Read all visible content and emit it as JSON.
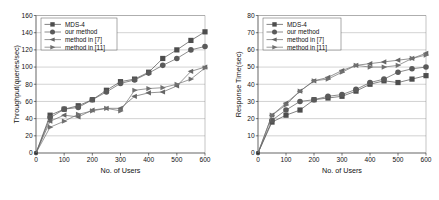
{
  "figure": {
    "panels": [
      "throughput-chart",
      "response-time-chart"
    ]
  },
  "chart_data": [
    {
      "id": "throughput-chart",
      "type": "line",
      "title": "",
      "xlabel": "No. of Users",
      "ylabel": "Throughput(queries/sec)",
      "xlim": [
        0,
        600
      ],
      "ylim": [
        0,
        160
      ],
      "xticks": [
        0,
        100,
        200,
        300,
        400,
        500,
        600
      ],
      "yticks": [
        0,
        20,
        40,
        60,
        80,
        100,
        120,
        140,
        160
      ],
      "xtick_labels": [
        "0",
        "100",
        "200",
        "300",
        "400",
        "500",
        "600"
      ],
      "ytick_labels": [
        "0",
        "20",
        "40",
        "60",
        "80",
        "100",
        "120",
        "140",
        "160"
      ],
      "grid": true,
      "legend_position": "upper-left",
      "x": [
        0,
        50,
        100,
        150,
        200,
        250,
        300,
        350,
        400,
        450,
        500,
        550,
        600
      ],
      "series": [
        {
          "name": "MDS-4",
          "marker": "square",
          "color": "#4d4d4d",
          "values": [
            0,
            44,
            51,
            55,
            62,
            73,
            83,
            86,
            94,
            110,
            120,
            131,
            141
          ]
        },
        {
          "name": "our method",
          "marker": "circle",
          "color": "#5a5a5a",
          "values": [
            0,
            41,
            51,
            53,
            62,
            71,
            81,
            85,
            93,
            102,
            110,
            120,
            124
          ]
        },
        {
          "name": "method in [7]",
          "marker": "triangle-left",
          "color": "#666666",
          "values": [
            0,
            37,
            44,
            42,
            50,
            52,
            52,
            66,
            70,
            71,
            78,
            95,
            100
          ]
        },
        {
          "name": "method in [11]",
          "marker": "triangle-right",
          "color": "#707070",
          "values": [
            0,
            30,
            37,
            45,
            49,
            52,
            49,
            73,
            75,
            76,
            80,
            86,
            99
          ]
        }
      ]
    },
    {
      "id": "response-time-chart",
      "type": "line",
      "title": "",
      "xlabel": "No. of Users",
      "ylabel": "Response Time(sec)",
      "xlim": [
        0,
        600
      ],
      "ylim": [
        0,
        80
      ],
      "xticks": [
        0,
        100,
        200,
        300,
        400,
        500,
        600
      ],
      "yticks": [
        0,
        10,
        20,
        30,
        40,
        50,
        60,
        70,
        80
      ],
      "xtick_labels": [
        "0",
        "100",
        "200",
        "300",
        "400",
        "500",
        "600"
      ],
      "ytick_labels": [
        "0",
        "10",
        "20",
        "30",
        "40",
        "50",
        "60",
        "70",
        "80"
      ],
      "grid": true,
      "legend_position": "upper-left",
      "x": [
        0,
        50,
        100,
        150,
        200,
        250,
        300,
        350,
        400,
        450,
        500,
        550,
        600
      ],
      "series": [
        {
          "name": "MDS-4",
          "marker": "square",
          "color": "#4d4d4d",
          "values": [
            0,
            18,
            22,
            25,
            31,
            32,
            33,
            36,
            40,
            42,
            41,
            43,
            45
          ]
        },
        {
          "name": "our method",
          "marker": "circle",
          "color": "#5a5a5a",
          "values": [
            0,
            19,
            25,
            30,
            31,
            33,
            34,
            37,
            41,
            43,
            47,
            49,
            50
          ]
        },
        {
          "name": "method in [7]",
          "marker": "triangle-left",
          "color": "#666666",
          "values": [
            0,
            22,
            29,
            36,
            42,
            44,
            48,
            51,
            52,
            53,
            54,
            55,
            58
          ]
        },
        {
          "name": "method in [11]",
          "marker": "triangle-right",
          "color": "#707070",
          "values": [
            0,
            22,
            28,
            36,
            42,
            43,
            47,
            51,
            50,
            50,
            51,
            55,
            57
          ]
        }
      ]
    }
  ]
}
